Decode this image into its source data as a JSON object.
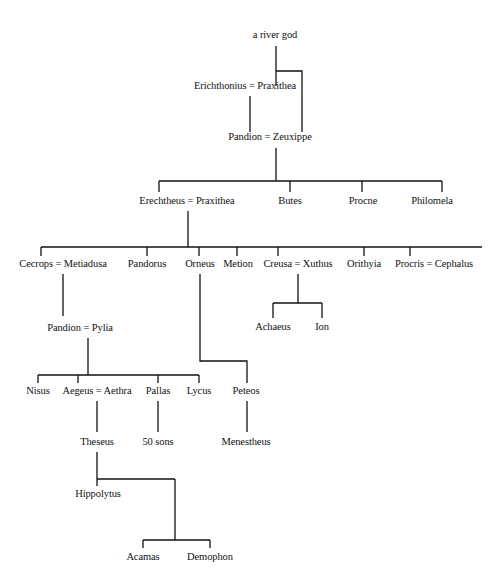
{
  "diagram": {
    "type": "family-tree",
    "line_color": "#111111",
    "background": "#ffffff",
    "nodes": [
      {
        "id": "river-god",
        "label": "a river god",
        "x": 275,
        "y": 35
      },
      {
        "id": "erichthonius-praxithea",
        "label": "Erichthonius = Praxithea",
        "x": 245,
        "y": 86
      },
      {
        "id": "pandion-zeuxippe",
        "label": "Pandion = Zeuxippe",
        "x": 270,
        "y": 137
      },
      {
        "id": "erechtheus-praxithea",
        "label": "Erechtheus = Praxithea",
        "x": 187,
        "y": 201
      },
      {
        "id": "butes",
        "label": "Butes",
        "x": 290,
        "y": 201
      },
      {
        "id": "procne",
        "label": "Procne",
        "x": 363,
        "y": 201
      },
      {
        "id": "philomela",
        "label": "Philomela",
        "x": 432,
        "y": 201
      },
      {
        "id": "cecrops-metiadusa",
        "label": "Cecrops = Metiadusa",
        "x": 63,
        "y": 264
      },
      {
        "id": "pandorus",
        "label": "Pandorus",
        "x": 147,
        "y": 264
      },
      {
        "id": "orneus",
        "label": "Orneus",
        "x": 200,
        "y": 264
      },
      {
        "id": "metion",
        "label": "Metion",
        "x": 238,
        "y": 264
      },
      {
        "id": "creusa-xuthus",
        "label": "Creusa = Xuthus",
        "x": 298,
        "y": 264
      },
      {
        "id": "orithyia",
        "label": "Orithyia",
        "x": 364,
        "y": 264
      },
      {
        "id": "procris-cephalus",
        "label": "Procris = Cephalus",
        "x": 434,
        "y": 264
      },
      {
        "id": "achaeus",
        "label": "Achaeus",
        "x": 273,
        "y": 327
      },
      {
        "id": "ion",
        "label": "Ion",
        "x": 322,
        "y": 327
      },
      {
        "id": "pandion-pylia",
        "label": "Pandion = Pylia",
        "x": 80,
        "y": 328
      },
      {
        "id": "nisus",
        "label": "Nisus",
        "x": 38,
        "y": 391
      },
      {
        "id": "aegeus-aethra",
        "label": "Aegeus = Aethra",
        "x": 97,
        "y": 391
      },
      {
        "id": "pallas",
        "label": "Pallas",
        "x": 158,
        "y": 391
      },
      {
        "id": "lycus",
        "label": "Lycus",
        "x": 199,
        "y": 391
      },
      {
        "id": "peteos",
        "label": "Peteos",
        "x": 246,
        "y": 391
      },
      {
        "id": "theseus",
        "label": "Theseus",
        "x": 97,
        "y": 442
      },
      {
        "id": "fifty-sons",
        "label": "50 sons",
        "x": 158,
        "y": 442
      },
      {
        "id": "menestheus",
        "label": "Menestheus",
        "x": 246,
        "y": 442
      },
      {
        "id": "hippolytus",
        "label": "Hippolytus",
        "x": 98,
        "y": 494
      },
      {
        "id": "acamas",
        "label": "Acamas",
        "x": 143,
        "y": 557
      },
      {
        "id": "demophon",
        "label": "Demophon",
        "x": 210,
        "y": 557
      }
    ],
    "lines": [
      "M276 46 V86",
      "M276 71 H302 V132",
      "M250 96 V132",
      "M276 148 V181",
      "M159 181 H442",
      "M159 181 V192",
      "M290 181 V192",
      "M362 181 V192",
      "M442 181 V192",
      "M188 211 V247",
      "M41 247 H482",
      "M41 247 V256",
      "M147 247 V256",
      "M199 247 V256",
      "M237 247 V256",
      "M278 247 V256",
      "M364 247 V256",
      "M410 247 V256",
      "M63 274 V316",
      "M298 274 V303",
      "M273 303 H322",
      "M273 303 V318",
      "M322 303 V318",
      "M200 274 V361 H247 V383",
      "M88 338 V375",
      "M38 375 H199",
      "M38 375 V383",
      "M78 375 V383",
      "M158 375 V383",
      "M199 375 V383",
      "M97 401 V432",
      "M158 401 V432",
      "M247 401 V432",
      "M97 452 V479",
      "M97 479 H175",
      "M97 479 V486",
      "M175 479 V540",
      "M143 540 H210",
      "M143 540 V548",
      "M210 540 V548"
    ]
  }
}
